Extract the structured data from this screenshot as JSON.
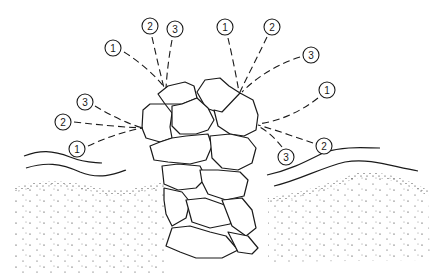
{
  "figure": {
    "ink_color": "#1a1a1a",
    "background_color": "#ffffff"
  },
  "callout_groups": [
    {
      "id": "top-left",
      "anchor": [
        166,
        88
      ],
      "labels": [
        {
          "text": "1",
          "cx": 113,
          "cy": 48
        },
        {
          "text": "2",
          "cx": 150,
          "cy": 26
        },
        {
          "text": "3",
          "cx": 175,
          "cy": 29
        }
      ]
    },
    {
      "id": "top-right",
      "anchor": [
        240,
        92
      ],
      "labels": [
        {
          "text": "1",
          "cx": 225,
          "cy": 27
        },
        {
          "text": "2",
          "cx": 272,
          "cy": 27
        },
        {
          "text": "3",
          "cx": 311,
          "cy": 55
        }
      ]
    },
    {
      "id": "left",
      "anchor": [
        143,
        128
      ],
      "labels": [
        {
          "text": "3",
          "cx": 85,
          "cy": 102
        },
        {
          "text": "2",
          "cx": 63,
          "cy": 122
        },
        {
          "text": "1",
          "cx": 77,
          "cy": 149
        }
      ]
    },
    {
      "id": "right",
      "anchor": [
        257,
        124
      ],
      "labels": [
        {
          "text": "1",
          "cx": 327,
          "cy": 90
        },
        {
          "text": "2",
          "cx": 324,
          "cy": 146
        },
        {
          "text": "3",
          "cx": 286,
          "cy": 157
        }
      ]
    }
  ],
  "labels": {
    "tl_1": "1",
    "tl_2": "2",
    "tl_3": "3",
    "tr_1": "1",
    "tr_2": "2",
    "tr_3": "3",
    "l_1": "1",
    "l_2": "2",
    "l_3": "3",
    "r_1": "1",
    "r_2": "2",
    "r_3": "3"
  }
}
